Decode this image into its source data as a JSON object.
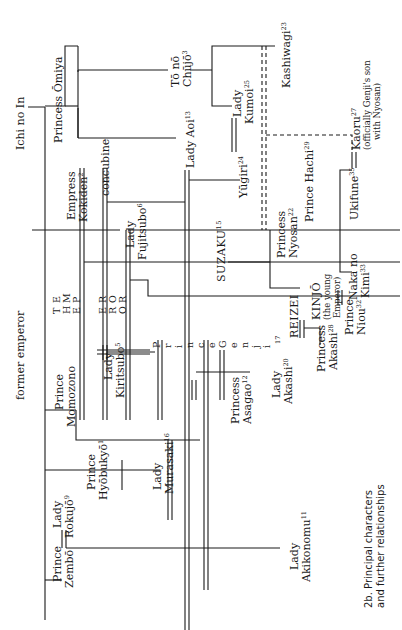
{
  "figure": {
    "caption_line1": "2b. Principal characters",
    "caption_line2": "and further relationships"
  },
  "people": {
    "ichi_no_in": "Ichi no In",
    "former_emperor": "former emperor",
    "princess_omiya_1": "Princess",
    "princess_omiya_2": "Ōmiya",
    "to_no_chujo_1": "Tō nō",
    "to_no_chujo_2": "Chūjō",
    "to_no_chujo_sup": "3",
    "kashiwagi": "Kashiwagi",
    "kashiwagi_sup": "23",
    "lady_kumoi_1": "Lady",
    "lady_kumoi_2": "Kumoi",
    "lady_kumoi_sup": "25",
    "lady_aoi": "Lady Aoi",
    "lady_aoi_sup": "13",
    "yugiri": "Yūgiri",
    "yugiri_sup": "24",
    "empress_kokiden_1": "Empress",
    "empress_kokiden_2": "Kokiden",
    "empress_kokiden_sup": "2",
    "concubine": "concubine",
    "lady_fujitsubo_1": "Lady",
    "lady_fujitsubo_2": "Fujitsubo",
    "lady_fujitsubo_sup": "6",
    "suzaku": "SUZAKU",
    "suzaku_sup": "15",
    "princess_nyosan_1": "Princess",
    "princess_nyosan_2": "Nyosan",
    "princess_nyosan_sup": "22",
    "prince_hachi": "Prince Hachi",
    "prince_hachi_sup": "29",
    "ukifune": "Ukifune",
    "ukifune_sup": "35",
    "kaoru": "Kaoru",
    "kaoru_sup": "27",
    "kaoru_note_1": "(officially Genji's son",
    "kaoru_note_2": "with Nyosan)",
    "naka_no_kimi_1": "Naka no",
    "naka_no_kimi_2": "Kimi",
    "naka_no_kimi_sup": "33",
    "reizei": "REIZEI",
    "kinjo": "KINJŌ",
    "kinjo_note_1": "(the young",
    "kinjo_note_2": "Emperor)",
    "princess_akashi_1": "Princess",
    "princess_akashi_2": "Akashi",
    "princess_akashi_sup": "28",
    "prince_niou_1": "Prince",
    "prince_niou_2": "Niou",
    "prince_niou_sup": "32",
    "lady_akashi_1": "Lady",
    "lady_akashi_2": "Akashi",
    "lady_akashi_sup": "20",
    "genji_sup": "17",
    "princess_asagao_1": "Princess",
    "princess_asagao_2": "Asagao",
    "princess_asagao_sup": "12",
    "lady_kiritsubo_1": "Lady",
    "lady_kiritsubo_2": "Kiritsubo",
    "lady_kiritsubo_sup": "5",
    "prince_momozono_1": "Prince",
    "prince_momozono_2": "Momozono",
    "prince_hyobukyo_1": "Prince",
    "prince_hyobukyo_2": "Hyōbukyō",
    "prince_hyobukyo_sup": "1",
    "lady_murasaki_1": "Lady",
    "lady_murasaki_2": "Murasaki",
    "lady_murasaki_sup": "16",
    "lady_rokujo_1": "Lady",
    "lady_rokujo_2": "Rokujō",
    "lady_rokujo_sup": "9",
    "prince_zembo_1": "Prince",
    "prince_zembo_2": "Zembō",
    "lady_akikonomu_1": "Lady",
    "lady_akikonomu_2": "Akikonomu",
    "lady_akikonomu_sup": "11"
  },
  "emperor_letters": {
    "col1": [
      "T",
      "H",
      "E"
    ],
    "col2": [
      "E",
      "M",
      "P"
    ],
    "col3": [
      "E",
      "R",
      "O"
    ],
    "col4": [
      "R",
      "O",
      "R"
    ]
  },
  "genji_letters": [
    "P",
    "r",
    "i",
    "n",
    "c",
    "e",
    "G",
    "e",
    "n",
    "j",
    "i"
  ]
}
